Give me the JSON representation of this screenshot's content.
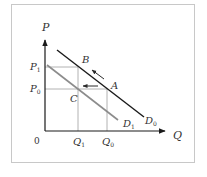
{
  "diagram": {
    "type": "demand-shift-diagram",
    "colors": {
      "frame": "#c8c8c8",
      "axis": "#1a1a1a",
      "d0_line": "#1a1a1a",
      "d1_line": "#8c8c8c",
      "guide": "#a0a0a0",
      "arrow": "#2a2a2a",
      "text": "#333333"
    },
    "axes": {
      "y_label": "P",
      "x_label": "Q",
      "origin_label": "0"
    },
    "price_ticks": [
      {
        "label": "P",
        "sub": "1"
      },
      {
        "label": "P",
        "sub": "0"
      }
    ],
    "quantity_ticks": [
      {
        "label": "Q",
        "sub": "1"
      },
      {
        "label": "Q",
        "sub": "0"
      }
    ],
    "curves": [
      {
        "id": "D0",
        "label": "D",
        "sub": "0",
        "style": "dark"
      },
      {
        "id": "D1",
        "label": "D",
        "sub": "1",
        "style": "gray"
      }
    ],
    "points": [
      {
        "label": "B"
      },
      {
        "label": "A"
      },
      {
        "label": "C"
      }
    ],
    "arrows": [
      {
        "from": "A",
        "to": "B",
        "meaning": "movement along D0"
      },
      {
        "from": "A",
        "to": "C",
        "meaning": "shift from D0 to D1"
      }
    ]
  }
}
